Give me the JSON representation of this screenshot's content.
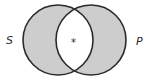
{
  "diagram": {
    "type": "venn",
    "sets": [
      {
        "id": "left",
        "label": "S",
        "cx": 58,
        "cy": 40,
        "r": 35,
        "shaded": true
      },
      {
        "id": "right",
        "label": "P",
        "cx": 91,
        "cy": 40,
        "r": 35,
        "shaded": true
      }
    ],
    "intersection": {
      "shaded": false,
      "marker": "*"
    },
    "colors": {
      "fill": "#cdcdcd",
      "stroke": "#2b2b2b",
      "background": "#ffffff"
    }
  }
}
